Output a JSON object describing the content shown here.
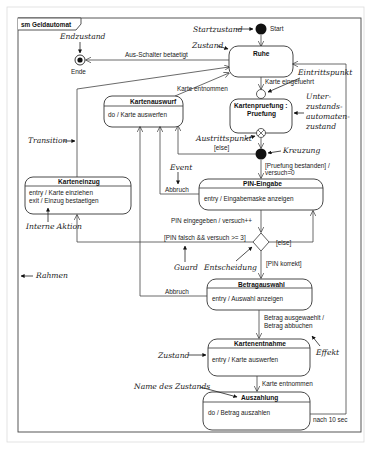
{
  "frame": {
    "title": "sm Geldautomat",
    "outline_color": "#444444",
    "page_border_color": "#d8d8d8"
  },
  "pseudostates": {
    "start": "Start",
    "end": "Ende"
  },
  "states": {
    "ruhe": {
      "name": "Ruhe"
    },
    "kartenpruefung": {
      "name_line1": "Kartenpruefung :",
      "name_line2": "Pruefung"
    },
    "kartenauswurf": {
      "name": "Kartenauswurf",
      "action": "do / Karte auswerfen"
    },
    "karteneinzug": {
      "name": "Karteneinzug",
      "action1": "entry / Karte einziehen",
      "action2": "exit / Einzug bestaetigen"
    },
    "pin_eingabe": {
      "name": "PIN-Eingabe",
      "action": "entry / Eingabemaske anzeigen"
    },
    "betragauswahl": {
      "name": "Betragauswahl",
      "action": "entry / Auswahl anzeigen"
    },
    "kartenentnahme": {
      "name": "Kartenentnahme",
      "action": "entry / Karte auswerfen"
    },
    "auszahlung": {
      "name": "Auszahlung",
      "action": "do / Betrag auszahlen"
    }
  },
  "transitions": {
    "aus_schalter": "Aus-Schalter betaetigt",
    "karte_entnommen_top": "Karte entnommen",
    "karte_eingefuehrt": "Karte eingefuehrt",
    "else_exit": "[else]",
    "pruefung_bestanden_1": "[Pruefung bestanden] /",
    "pruefung_bestanden_2": "versuch=0",
    "abbruch_pin": "Abbruch",
    "pin_eingegeben": "PIN eingegeben / versuch++",
    "pin_falsch": "[PIN falsch && versuch >= 3]",
    "else_decision": "[else]",
    "pin_korrekt": "[PIN korrekt]",
    "abbruch_betrag": "Abbruch",
    "betrag_1": "Betrag ausgewaehlt /",
    "betrag_2": "Betrag abbuchen",
    "karte_entnommen_bottom": "Karte entnommen",
    "nach_10": "nach 10 sec"
  },
  "annotations": {
    "startzustand": "Startzustand",
    "endzustand": "Endzustand",
    "zustand_top": "Zustand",
    "eintrittspunkt": "Eintrittspunkt",
    "unter_1": "Unter-",
    "unter_2": "zustands-",
    "unter_3": "automaten-",
    "unter_4": "zustand",
    "austrittspunkt": "Austrittspunkt",
    "kreuzung": "Kreuzung",
    "transition": "Transition",
    "event": "Event",
    "interne_aktion": "Interne Aktion",
    "rahmen": "Rahmen",
    "guard": "Guard",
    "entscheidung": "Entscheidung",
    "effekt": "Effekt",
    "zustand_bottom": "Zustand",
    "name_des_zustands": "Name des Zustands"
  }
}
